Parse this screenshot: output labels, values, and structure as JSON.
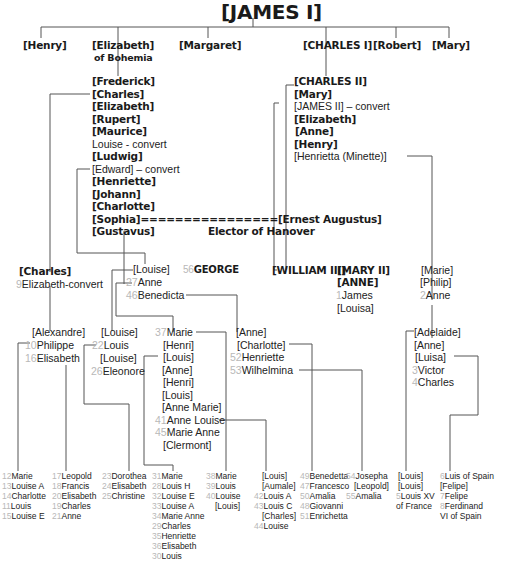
{
  "title": "[JAMES I]",
  "gen1": {
    "henry": "[Henry]",
    "elizabeth": "[Elizabeth]",
    "elizabeth_sub": "of Bohemia",
    "margaret": "[Margaret]",
    "charles1": "[CHARLES I]",
    "robert": "[Robert]",
    "mary": "[Mary]"
  },
  "bohemia_children": [
    {
      "label": "[Frederick]",
      "style": "bold"
    },
    {
      "label": "[Charles]",
      "style": "bold"
    },
    {
      "label": "[Elizabeth]",
      "style": "bold"
    },
    {
      "label": "[Rupert]",
      "style": "bold"
    },
    {
      "label": "[Maurice]",
      "style": "bold"
    },
    {
      "label": " Louise - convert",
      "style": "normal"
    },
    {
      "label": "[Ludwig]",
      "style": "bold"
    },
    {
      "label": "[Edward] – convert",
      "style": "normal"
    },
    {
      "label": "[Henriette]",
      "style": "bold"
    },
    {
      "label": "[Johann]",
      "style": "bold"
    },
    {
      "label": "[Charlotte]",
      "style": "bold"
    },
    {
      "label": "[Sophia]================[Ernest Augustus]",
      "style": "bold"
    },
    {
      "label": "[Gustavus]",
      "style": "bold"
    }
  ],
  "elector": "Elector of Hanover",
  "charles1_children": [
    {
      "label": "[CHARLES II]",
      "style": "bold"
    },
    {
      "label": "[Mary]",
      "style": "bold"
    },
    {
      "label": "[JAMES II] – convert",
      "style": "normal"
    },
    {
      "label": "[Elizabeth]",
      "style": "bold"
    },
    {
      "label": "[Anne]",
      "style": "bold"
    },
    {
      "label": "[Henry]",
      "style": "bold"
    },
    {
      "label": "[Henrietta (Minette)]",
      "style": "normal"
    }
  ],
  "gen3": {
    "charles": "[Charles]",
    "elizabeth_convert_num": "9",
    "elizabeth_convert": "Elizabeth-convert",
    "louise": "[Louise]",
    "anne_num": "27",
    "anne": "Anne",
    "benedicta_num": "46",
    "benedicta": "Benedicta",
    "george_num": "56",
    "george": "GEORGE",
    "william3": "[WILLIAM III]",
    "mary2": "[MARY II]",
    "anne_q": "[ANNE]",
    "james_num": "1",
    "james": "James",
    "louisa": "[Louisa]",
    "marie": "[Marie]",
    "philip": "[Philip]",
    "anne2_num": "2",
    "anne2": "Anne"
  },
  "gen4": {
    "alexandre": "[Alexandre]",
    "philippe_num": "10",
    "philippe": "Philippe",
    "elisabeth_num": "16",
    "elisabeth": "Elisabeth",
    "louise_a": "[Louise]",
    "louis_num": "22",
    "louis": "Louis",
    "louise_b": "[Louise]",
    "eleonore_num": "26",
    "eleonore": "Eleonore",
    "marie_col": [
      {
        "num": "37",
        "label": "Marie"
      },
      {
        "num": "",
        "label": "[Henri]"
      },
      {
        "num": "",
        "label": "[Louis]"
      },
      {
        "num": "",
        "label": "[Anne]"
      },
      {
        "num": "",
        "label": "[Henri]"
      },
      {
        "num": "",
        "label": "[Louis]"
      },
      {
        "num": "",
        "label": "[Anne Marie]"
      },
      {
        "num": "41",
        "label": "Anne Louise"
      },
      {
        "num": "45",
        "label": "Marie Anne"
      },
      {
        "num": "",
        "label": "[Clermont]"
      }
    ],
    "anne_col": [
      {
        "num": "",
        "label": "[Anne]"
      },
      {
        "num": "",
        "label": "[Charlotte]"
      },
      {
        "num": "52",
        "label": "Henriette"
      },
      {
        "num": "53",
        "label": "Wilhelmina"
      }
    ],
    "adelaide_col": [
      {
        "num": "",
        "label": "[Adelaide]"
      },
      {
        "num": "",
        "label": "[Anne]"
      },
      {
        "num": "",
        "label": "[Luisa]"
      },
      {
        "num": "3",
        "label": "Victor"
      },
      {
        "num": "4",
        "label": "Charles"
      }
    ]
  },
  "gen5": [
    {
      "x": 2,
      "items": [
        {
          "num": "12",
          "label": "Marie"
        },
        {
          "num": "13",
          "label": "Louise A"
        },
        {
          "num": "14",
          "label": "Charlotte"
        },
        {
          "num": "11",
          "label": "Louis"
        },
        {
          "num": "15",
          "label": "Louise E"
        }
      ]
    },
    {
      "x": 52,
      "items": [
        {
          "num": "17",
          "label": "Leopold"
        },
        {
          "num": "18",
          "label": "Francis"
        },
        {
          "num": "20",
          "label": "Elisabeth"
        },
        {
          "num": "19",
          "label": "Charles"
        },
        {
          "num": "21",
          "label": "Anne"
        }
      ]
    },
    {
      "x": 102,
      "items": [
        {
          "num": "23",
          "label": "Dorothea"
        },
        {
          "num": "24",
          "label": "Elisabeth"
        },
        {
          "num": "25",
          "label": "Christine"
        }
      ]
    },
    {
      "x": 152,
      "items": [
        {
          "num": "31",
          "label": "Marie"
        },
        {
          "num": "28",
          "label": "Louis H"
        },
        {
          "num": "32",
          "label": "Louise E"
        },
        {
          "num": "33",
          "label": "Louise A"
        },
        {
          "num": "34",
          "label": "Marie Anne"
        },
        {
          "num": "29",
          "label": "Charles"
        },
        {
          "num": "35",
          "label": "Henriette"
        },
        {
          "num": "36",
          "label": "Elisabeth"
        },
        {
          "num": "30",
          "label": "Louis"
        }
      ]
    },
    {
      "x": 206,
      "items": [
        {
          "num": "38",
          "label": "Marie"
        },
        {
          "num": "39",
          "label": "Louis"
        },
        {
          "num": "40",
          "label": "Louise"
        },
        {
          "num": "",
          "label": "[Louis]",
          "indent": 9
        }
      ]
    },
    {
      "x": 254,
      "items": [
        {
          "num": "",
          "label": "[Louis]",
          "indent": 8
        },
        {
          "num": "",
          "label": "[Aumale]",
          "indent": 8
        },
        {
          "num": "42",
          "label": "Louis A"
        },
        {
          "num": "43",
          "label": "Louis C"
        },
        {
          "num": "",
          "label": "[Charles]",
          "indent": 8
        },
        {
          "num": "44",
          "label": "Louise"
        }
      ]
    },
    {
      "x": 300,
      "items": [
        {
          "num": "49",
          "label": "Benedetta"
        },
        {
          "num": "47",
          "label": "Francesco"
        },
        {
          "num": "50",
          "label": "Amalia"
        },
        {
          "num": "48",
          "label": "Giovanni"
        },
        {
          "num": "51",
          "label": "Enrichetta"
        }
      ]
    },
    {
      "x": 346,
      "items": [
        {
          "num": "54",
          "label": "Josepha"
        },
        {
          "num": "",
          "label": "[Leopold]",
          "indent": 8
        },
        {
          "num": "55",
          "label": "Amalia"
        }
      ]
    },
    {
      "x": 396,
      "items": [
        {
          "num": "",
          "label": "[Louis]",
          "indent": 2
        },
        {
          "num": "",
          "label": "[Louis]",
          "indent": 2
        },
        {
          "num": "5",
          "label": "Louis XV"
        },
        {
          "num": "",
          "label": "of France"
        }
      ]
    },
    {
      "x": 440,
      "items": [
        {
          "num": "6",
          "label": "Luis of Spain"
        },
        {
          "num": "",
          "label": "[Felipe]"
        },
        {
          "num": "7",
          "label": "Felipe"
        },
        {
          "num": "8",
          "label": "Ferdinand"
        },
        {
          "num": "",
          "label": "VI  of Spain"
        }
      ]
    }
  ],
  "colors": {
    "line": "#555555",
    "text": "#1a1a1a",
    "number": "#b8b8b8",
    "background": "#ffffff"
  }
}
